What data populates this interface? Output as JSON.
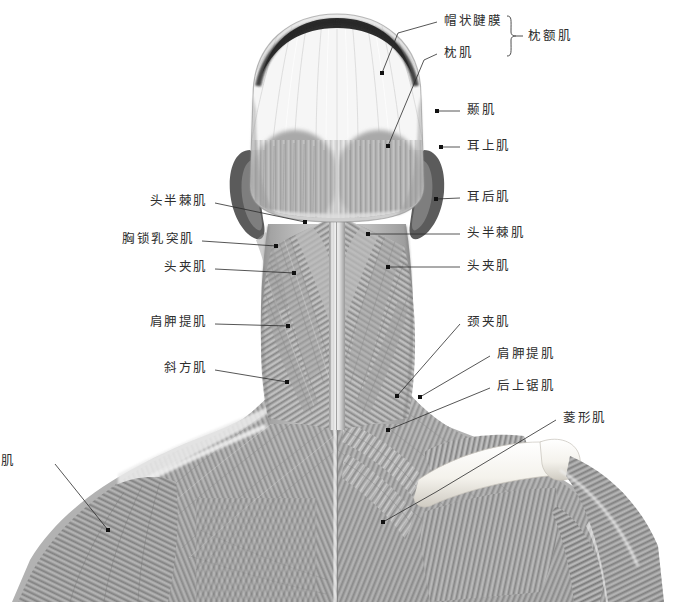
{
  "figure": {
    "view": "posterior",
    "background_color": "#ffffff",
    "ink_color": "#2b2b2b",
    "tone_light": "#f2f2f2",
    "tone_mid": "#b4b4b4",
    "tone_dark": "#6e6e6e",
    "tone_shadow": "#3a3a3a"
  },
  "group_brackets": [
    {
      "id": "occipitofrontalis-bracket",
      "label": "枕额肌",
      "members": [
        "帽状腱膜",
        "枕肌"
      ],
      "label_x": 528,
      "label_y": 36,
      "bracket_x": 512,
      "bracket_top": 16,
      "bracket_bottom": 56
    }
  ],
  "labels": [
    {
      "id": "galea-aponeurotica",
      "text": "帽状腱膜",
      "side": "right",
      "text_x": 444,
      "text_y": 21,
      "line": [
        [
          437,
          22
        ],
        [
          398,
          33
        ],
        [
          382,
          73
        ]
      ],
      "dot": [
        382,
        73
      ]
    },
    {
      "id": "occipitalis",
      "text": "枕肌",
      "side": "right",
      "text_x": 444,
      "text_y": 53,
      "line": [
        [
          437,
          54
        ],
        [
          424,
          60
        ],
        [
          388,
          146
        ]
      ],
      "dot": [
        388,
        146
      ]
    },
    {
      "id": "temporalis",
      "text": "颞肌",
      "side": "right",
      "text_x": 467,
      "text_y": 110,
      "line": [
        [
          460,
          111
        ],
        [
          437,
          111
        ]
      ],
      "dot": [
        437,
        111
      ]
    },
    {
      "id": "auricularis-superior",
      "text": "耳上肌",
      "side": "right",
      "text_x": 467,
      "text_y": 146,
      "line": [
        [
          460,
          147
        ],
        [
          441,
          147
        ]
      ],
      "dot": [
        441,
        147
      ]
    },
    {
      "id": "auricularis-posterior",
      "text": "耳后肌",
      "side": "right",
      "text_x": 467,
      "text_y": 197,
      "line": [
        [
          460,
          198
        ],
        [
          436,
          199
        ]
      ],
      "dot": [
        436,
        199
      ]
    },
    {
      "id": "semispinalis-capitis-right",
      "text": "头半棘肌",
      "side": "right",
      "text_x": 467,
      "text_y": 233,
      "line": [
        [
          460,
          234
        ],
        [
          368,
          234
        ]
      ],
      "dot": [
        368,
        234
      ]
    },
    {
      "id": "splenius-capitis-right",
      "text": "头夹肌",
      "side": "right",
      "text_x": 467,
      "text_y": 266,
      "line": [
        [
          460,
          267
        ],
        [
          388,
          267
        ]
      ],
      "dot": [
        388,
        267
      ]
    },
    {
      "id": "splenius-cervicis",
      "text": "颈夹肌",
      "side": "right",
      "text_x": 467,
      "text_y": 322,
      "line": [
        [
          460,
          324
        ],
        [
          397,
          396
        ]
      ],
      "dot": [
        397,
        396
      ]
    },
    {
      "id": "levator-scapulae-right",
      "text": "肩胛提肌",
      "side": "right",
      "text_x": 497,
      "text_y": 354,
      "line": [
        [
          490,
          356
        ],
        [
          420,
          397
        ]
      ],
      "dot": [
        420,
        397
      ]
    },
    {
      "id": "serratus-posterior-superior",
      "text": "后上锯肌",
      "side": "right",
      "text_x": 497,
      "text_y": 386,
      "line": [
        [
          490,
          388
        ],
        [
          388,
          430
        ]
      ],
      "dot": [
        388,
        430
      ]
    },
    {
      "id": "rhomboid",
      "text": "菱形肌",
      "side": "right",
      "text_x": 563,
      "text_y": 418,
      "line": [
        [
          556,
          420
        ],
        [
          436,
          492
        ],
        [
          383,
          522
        ]
      ],
      "dot": [
        383,
        522
      ]
    },
    {
      "id": "semispinalis-capitis-left",
      "text": "头半棘肌",
      "side": "left",
      "text_x": 208,
      "text_y": 201,
      "line": [
        [
          215,
          203
        ],
        [
          305,
          222
        ]
      ],
      "dot": [
        305,
        222
      ]
    },
    {
      "id": "sternocleidomastoid",
      "text": "胸锁乳突肌",
      "side": "left",
      "text_x": 195,
      "text_y": 239,
      "line": [
        [
          202,
          241
        ],
        [
          276,
          246
        ]
      ],
      "dot": [
        276,
        246
      ]
    },
    {
      "id": "splenius-capitis-left",
      "text": "头夹肌",
      "side": "left",
      "text_x": 208,
      "text_y": 267,
      "line": [
        [
          215,
          269
        ],
        [
          294,
          273
        ]
      ],
      "dot": [
        294,
        273
      ]
    },
    {
      "id": "levator-scapulae-left",
      "text": "肩胛提肌",
      "side": "left",
      "text_x": 208,
      "text_y": 322,
      "line": [
        [
          215,
          324
        ],
        [
          288,
          326
        ]
      ],
      "dot": [
        288,
        326
      ]
    },
    {
      "id": "trapezius",
      "text": "斜方肌",
      "side": "left",
      "text_x": 208,
      "text_y": 368,
      "line": [
        [
          215,
          370
        ],
        [
          287,
          382
        ]
      ],
      "dot": [
        287,
        382
      ]
    },
    {
      "id": "deltoid",
      "text": "三角肌",
      "side": "left",
      "text_x": 16,
      "text_y": 461,
      "line": [
        [
          55,
          464
        ],
        [
          108,
          530
        ]
      ],
      "dot": [
        108,
        530
      ]
    }
  ]
}
